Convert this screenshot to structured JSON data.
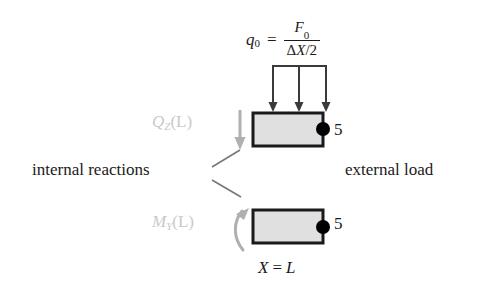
{
  "diagram": {
    "title_formula": {
      "lhs": "q",
      "lhs_sub": "0",
      "equals": "=",
      "numerator": "F",
      "numerator_sub": "0",
      "denominator_delta": "Δ",
      "denominator_var": "X",
      "denominator_div": "/2"
    },
    "internal_reactions_label": "internal reactions",
    "external_load_label": "external load",
    "position_label": {
      "variable": "X",
      "equals": "=",
      "value": "L"
    },
    "shear_label": {
      "symbol": "Q",
      "subscript": "Z",
      "argument": "(L)"
    },
    "moment_label": {
      "symbol": "M",
      "subscript": "Y",
      "argument": "(L)"
    },
    "node_number_top": "5",
    "node_number_bottom": "5",
    "colors": {
      "background": "#ffffff",
      "text": "#1a1a1a",
      "gray_label": "#c9c9c9",
      "gray_arrow": "#b0b0b0",
      "block_fill": "#e0e0e0",
      "block_border": "#1a1a1a",
      "node_dot": "#000000",
      "leader_line": "#777777"
    },
    "elements": {
      "distributed_load_arrows": 3,
      "top_block": "beam-element-with-distributed-load",
      "bottom_block": "beam-element-with-moment"
    }
  }
}
